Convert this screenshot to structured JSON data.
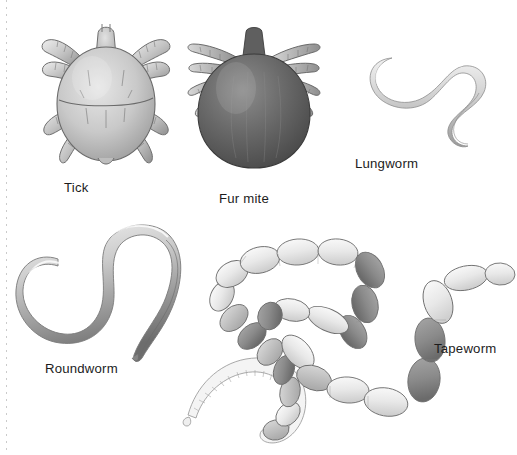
{
  "plate": {
    "title": "Parasites illustration plate",
    "background_color": "#ffffff",
    "ink_color": "#3a3a3a",
    "margin_rule": "dashed-left-margin"
  },
  "figures": [
    {
      "id": "tick",
      "label": "Tick",
      "type": "arachnid",
      "description": "Dorsal view of a tick with rounded oval body, scutum line across the back and eight banded legs",
      "shade": "light-gray",
      "legs": 8,
      "label_x": 64,
      "label_y": 180
    },
    {
      "id": "fur-mite",
      "label": "Fur mite",
      "type": "arachnid",
      "description": "Dark ovoid bodied mite with small capitulum at top and splayed banded legs",
      "shade": "dark-gray",
      "legs": 8,
      "label_x": 219,
      "label_y": 191
    },
    {
      "id": "lungworm",
      "label": "Lungworm",
      "type": "nematode",
      "description": "Slender S-curved thread-like worm",
      "shade": "pale-gray",
      "label_x": 355,
      "label_y": 156
    },
    {
      "id": "roundworm",
      "label": "Roundworm",
      "type": "nematode",
      "description": "Thick S-shaped worm with tapering hooked ends",
      "shade": "mid-gray",
      "label_x": 45,
      "label_y": 361
    },
    {
      "id": "tapeworm",
      "label": "Tapeworm",
      "type": "cestode",
      "description": "Long segmented worm forming a loop, alternating pale and dark proglottid segments with a finely segmented thin neck and scolex",
      "shade": "mixed-light-and-dark",
      "label_x": 434,
      "label_y": 341
    }
  ]
}
